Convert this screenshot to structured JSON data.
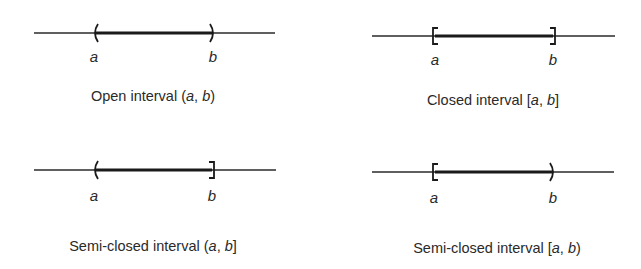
{
  "panels": [
    {
      "id": "open",
      "caption_text": "Open interval",
      "notation_open": "(",
      "var_a": "a",
      "sep": ", ",
      "var_b": "b",
      "notation_close": ")",
      "left_endpoint": "open",
      "right_endpoint": "open",
      "label_a": "a",
      "label_b": "b"
    },
    {
      "id": "closed",
      "caption_text": "Closed interval",
      "notation_open": "[",
      "var_a": "a",
      "sep": ", ",
      "var_b": "b",
      "notation_close": "]",
      "left_endpoint": "closed",
      "right_endpoint": "closed",
      "label_a": "a",
      "label_b": "b"
    },
    {
      "id": "semi-closed-right",
      "caption_text": "Semi-closed interval",
      "notation_open": "(",
      "var_a": "a",
      "sep": ", ",
      "var_b": "b",
      "notation_close": "]",
      "left_endpoint": "open",
      "right_endpoint": "closed",
      "label_a": "a",
      "label_b": "b"
    },
    {
      "id": "semi-closed-left",
      "caption_text": "Semi-closed interval",
      "notation_open": "[",
      "var_a": "a",
      "sep": ", ",
      "var_b": "b",
      "notation_close": ")",
      "left_endpoint": "closed",
      "right_endpoint": "open",
      "label_a": "a",
      "label_b": "b"
    }
  ],
  "colors": {
    "ink": "#2a2a2a",
    "background": "#ffffff"
  }
}
